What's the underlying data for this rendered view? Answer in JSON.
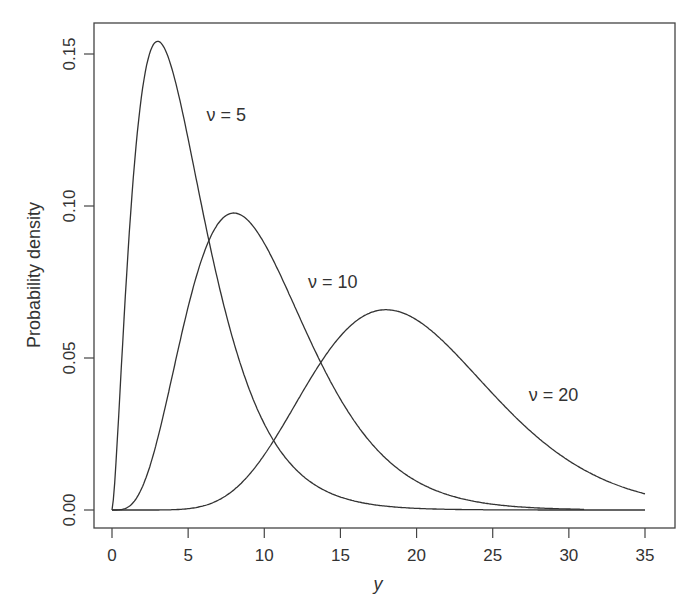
{
  "chart_data": {
    "type": "line",
    "title": "",
    "xlabel": "y",
    "ylabel": "Probability density",
    "xlim": [
      0,
      35
    ],
    "ylim": [
      0,
      0.155
    ],
    "xticks": [
      "0",
      "5",
      "10",
      "15",
      "20",
      "25",
      "30",
      "35"
    ],
    "yticks": [
      "0.00",
      "0.05",
      "0.10",
      "0.15"
    ],
    "grid": false,
    "series": [
      {
        "name": "ν = 5",
        "df": 5,
        "x_range": [
          0,
          35
        ],
        "peak": {
          "x": 3,
          "y": 0.154
        }
      },
      {
        "name": "ν = 10",
        "df": 10,
        "x_range": [
          0,
          31
        ],
        "peak": {
          "x": 8,
          "y": 0.098
        }
      },
      {
        "name": "ν = 20",
        "df": 20,
        "x_range": [
          0,
          35
        ],
        "peak": {
          "x": 18,
          "y": 0.066
        }
      }
    ],
    "annotations": [
      {
        "text": "ν = 5",
        "x": 7.5,
        "y": 0.128
      },
      {
        "text": "ν = 10",
        "x": 14.5,
        "y": 0.073
      },
      {
        "text": "ν = 20",
        "x": 29,
        "y": 0.036
      }
    ]
  }
}
